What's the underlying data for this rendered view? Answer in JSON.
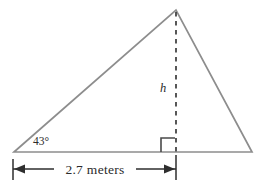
{
  "figure": {
    "type": "geometry-diagram",
    "background_color": "#ffffff",
    "labels": {
      "angle": "43°",
      "height": "h",
      "base_dimension": "2.7 meters"
    },
    "colors": {
      "triangle_stroke": "#8d8d8d",
      "dashed_height_stroke": "#3a3a3a",
      "right_angle_stroke": "#4a4a4a",
      "dimension_stroke": "#2e2e2e",
      "text": "#2b2b2b"
    },
    "geometry": {
      "apex": {
        "x": 176,
        "y": 10
      },
      "left_vertex": {
        "x": 14,
        "y": 152
      },
      "right_vertex": {
        "x": 252,
        "y": 152
      },
      "foot_of_height": {
        "x": 176,
        "y": 152
      },
      "right_angle_size": 14,
      "dimension_line_y": 169,
      "dimension_left_x": 13,
      "dimension_right_x": 176
    },
    "annotations": {
      "angle_label_position": {
        "x": 33,
        "y": 145
      },
      "height_label_position": {
        "x": 163,
        "y": 92
      },
      "dimension_label_position": {
        "x": 94,
        "y": 174
      }
    }
  }
}
